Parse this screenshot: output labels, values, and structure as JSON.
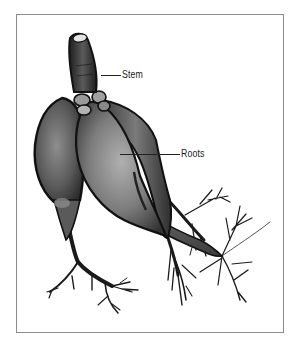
{
  "figure": {
    "type": "botanical-illustration",
    "labels": [
      {
        "id": "stem",
        "text": "Stem"
      },
      {
        "id": "roots",
        "text": "Roots"
      }
    ]
  },
  "colors": {
    "frame_border": "#8c8c8c",
    "outline": "#111111",
    "root_dark": "#2a2a2a",
    "root_mid": "#6e6e6e",
    "root_light": "#a8a8a8",
    "background": "#ffffff"
  }
}
